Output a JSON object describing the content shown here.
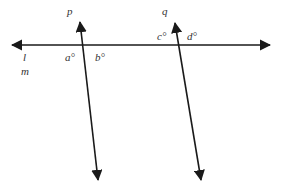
{
  "diagram": {
    "line_color": "#1a1a1a",
    "label_color": "#333333",
    "lines": {
      "l": {
        "label": "l",
        "x1": 12,
        "y1": 45,
        "x2": 270,
        "y2": 45,
        "arrows": "both"
      },
      "p": {
        "label": "p",
        "x1": 80,
        "y1": 22,
        "x2": 98,
        "y2": 180,
        "arrows": "both"
      },
      "q": {
        "label": "q",
        "x1": 175,
        "y1": 23,
        "x2": 201,
        "y2": 180,
        "arrows": "both"
      }
    },
    "labels": {
      "p": "p",
      "q": "q",
      "l": "l",
      "m": "m",
      "a": "a°",
      "b": "b°",
      "c": "c°",
      "d": "d°"
    }
  }
}
